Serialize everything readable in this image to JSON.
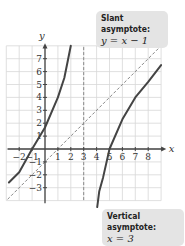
{
  "chart_data": {
    "type": "line",
    "title": "",
    "xlabel": "x",
    "ylabel": "y",
    "xlim": [
      -2.8,
      9
    ],
    "ylim": [
      -4,
      8
    ],
    "x_ticks": [
      -2,
      -1,
      1,
      2,
      3,
      4,
      5,
      6,
      7,
      8
    ],
    "y_ticks": [
      -3,
      -2,
      -1,
      1,
      2,
      3,
      4,
      5,
      6,
      7
    ],
    "x_tick_labels": [
      "−2",
      "−1",
      "1",
      "2",
      "3",
      "4",
      "5",
      "6",
      "7",
      "8"
    ],
    "y_tick_labels": [
      "−3",
      "−2",
      "−1",
      "1",
      "2",
      "3",
      "4",
      "5",
      "6",
      "7"
    ],
    "grid": true,
    "function_description": "Rational function with vertical asymptote x = 3 and slant asymptote y = x − 1; x-intercepts at −1 and 5; y-intercept about 5/3",
    "series": [
      {
        "name": "left branch",
        "x": [
          -2.8,
          -2,
          -1,
          0,
          1,
          1.5,
          1.8,
          2
        ],
        "y": [
          -2.6,
          -1.8,
          0,
          1.67,
          4,
          5.5,
          7,
          8
        ]
      },
      {
        "name": "right branch",
        "x": [
          4.05,
          4.2,
          4.5,
          5,
          6,
          7,
          8,
          9
        ],
        "y": [
          -4.5,
          -3.3,
          -2.2,
          0,
          2.3,
          4,
          5.2,
          6.5
        ]
      }
    ],
    "asymptotes": [
      {
        "type": "slant",
        "equation": "y = x − 1",
        "slope": 1,
        "intercept": -1
      },
      {
        "type": "vertical",
        "equation": "x = 3",
        "x": 3
      }
    ],
    "annotations": [
      {
        "title": "Slant asymptote:",
        "text": "y = x − 1",
        "placement": "top-right"
      },
      {
        "title": "Vertical asymptote:",
        "text": "x = 3",
        "placement": "bottom-right"
      }
    ]
  },
  "colors": {
    "curve": "#444444",
    "grid": "#d8d8d8",
    "axis": "#444444",
    "asymptote": "#888888",
    "callout_bg": "#e4e4e4"
  }
}
